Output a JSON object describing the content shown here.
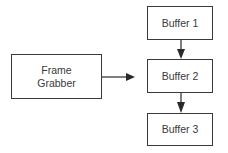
{
  "diagram": {
    "type": "flowchart",
    "colors": {
      "background": "#ffffff",
      "stroke": "#3a3a3a",
      "text": "#3a3a3a"
    },
    "nodes": [
      {
        "id": "frame_grabber",
        "label": "Frame\nGrabber"
      },
      {
        "id": "buffer1",
        "label": "Buffer 1"
      },
      {
        "id": "buffer2",
        "label": "Buffer 2"
      },
      {
        "id": "buffer3",
        "label": "Buffer 3"
      }
    ],
    "edges": [
      {
        "from": "frame_grabber",
        "to": "buffer2",
        "direction": "right"
      },
      {
        "from": "buffer1",
        "to": "buffer2",
        "direction": "down"
      },
      {
        "from": "buffer2",
        "to": "buffer3",
        "direction": "down"
      }
    ]
  }
}
